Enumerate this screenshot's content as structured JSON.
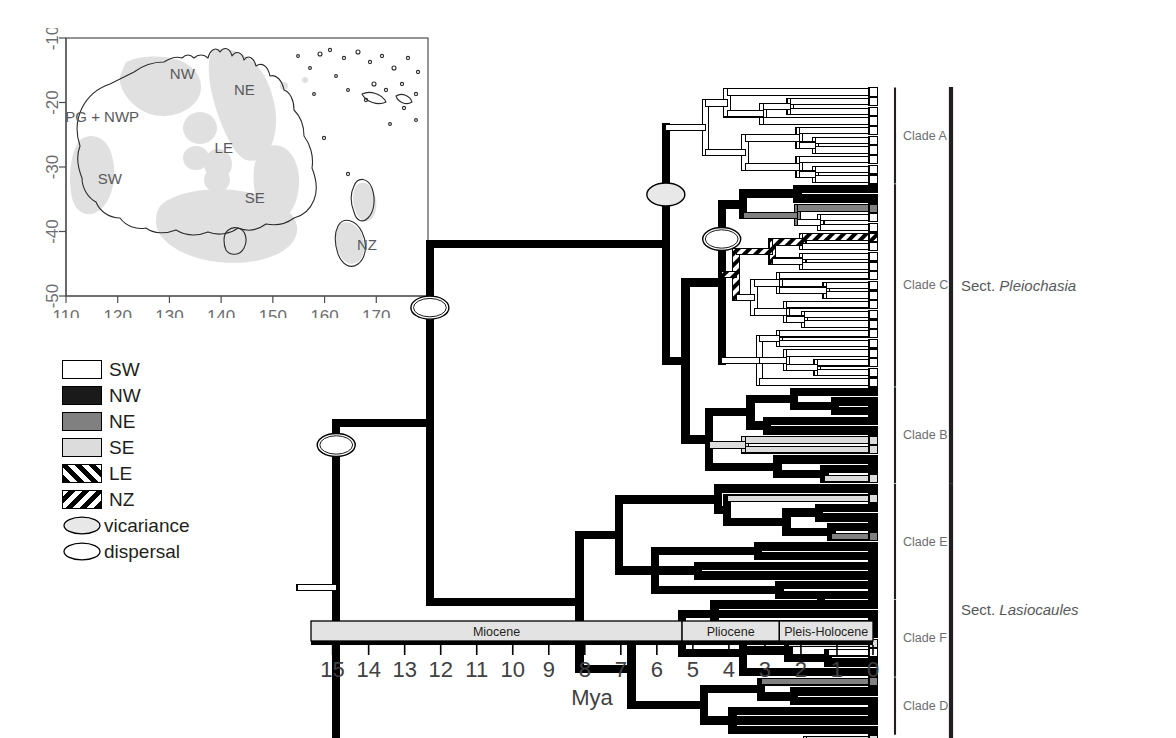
{
  "figure": {
    "type": "phylogenetic-chronogram-with-map-inset",
    "organism_group": "Utricularia (bladderworts)"
  },
  "map": {
    "title": "",
    "x_axis": {
      "ticks": [
        "110",
        "120",
        "130",
        "140",
        "150",
        "160",
        "170",
        "180"
      ],
      "min": 110,
      "max": 180
    },
    "y_axis": {
      "ticks": [
        "-10",
        "-20",
        "-30",
        "-40",
        "-50"
      ],
      "min": -50,
      "max": -10
    },
    "region_labels": [
      {
        "name": "NW",
        "text": "NW",
        "lon": 132.5,
        "lat": -15.5
      },
      {
        "name": "NE",
        "text": "NE",
        "lon": 144.5,
        "lat": -18.0
      },
      {
        "name": "PG + NWP",
        "text": "PG + NWP",
        "lon": 117.0,
        "lat": -22.2
      },
      {
        "name": "LE",
        "text": "LE",
        "lon": 140.5,
        "lat": -27.0
      },
      {
        "name": "SW",
        "text": "SW",
        "lon": 118.5,
        "lat": -31.8
      },
      {
        "name": "SE",
        "text": "SE",
        "lon": 146.5,
        "lat": -34.8
      },
      {
        "name": "NZ",
        "text": "NZ",
        "lon": 168.2,
        "lat": -42.0
      }
    ]
  },
  "legend": {
    "items": [
      {
        "label": "SW",
        "kind": "swatch",
        "fill": "#ffffff"
      },
      {
        "label": "NW",
        "kind": "swatch",
        "fill": "#1a1a1a"
      },
      {
        "label": "NE",
        "kind": "swatch",
        "fill": "#808080"
      },
      {
        "label": "SE",
        "kind": "swatch",
        "fill": "#dcdcdc"
      },
      {
        "label": "LE",
        "kind": "hatch",
        "fill": "#ffffff",
        "hatch": "forward"
      },
      {
        "label": "NZ",
        "kind": "hatch",
        "fill": "#ffffff",
        "hatch": "back"
      },
      {
        "label": "vicariance",
        "kind": "ellipse",
        "fill": "#e8e8e8"
      },
      {
        "label": "dispersal",
        "kind": "ellipse",
        "fill": "#ffffff"
      }
    ]
  },
  "axis": {
    "title": "Mya",
    "ticks": [
      "15",
      "14",
      "13",
      "12",
      "11",
      "10",
      "9",
      "8",
      "7",
      "6",
      "5",
      "4",
      "3",
      "2",
      "1",
      "0"
    ],
    "max_mya": 15.6,
    "min_mya": 0,
    "epochs": [
      {
        "name": "Miocene",
        "start": 15.6,
        "end": 5.3
      },
      {
        "name": "Pliocene",
        "start": 5.3,
        "end": 2.6
      },
      {
        "name": "Pleis-Holocene",
        "start": 2.6,
        "end": 0
      }
    ]
  },
  "clades": [
    {
      "id": "A",
      "label": "Clade A",
      "tip_start": 0,
      "tip_end": 9
    },
    {
      "id": "C",
      "label": "Clade C",
      "tip_start": 10,
      "tip_end": 30
    },
    {
      "id": "B",
      "label": "Clade B",
      "tip_start": 31,
      "tip_end": 40
    },
    {
      "id": "E",
      "label": "Clade E",
      "tip_start": 41,
      "tip_end": 52
    },
    {
      "id": "F",
      "label": "Clade F",
      "tip_start": 53,
      "tip_end": 60
    },
    {
      "id": "D",
      "label": "Clade D",
      "tip_start": 61,
      "tip_end": 66
    }
  ],
  "sections": [
    {
      "label_prefix": "Sect. ",
      "label_italic": "Pleiochasia",
      "tip_start": 0,
      "tip_end": 40
    },
    {
      "label_prefix": "Sect. ",
      "label_italic": "Lasiocaules",
      "tip_start": 41,
      "tip_end": 66
    },
    {
      "label_prefix": "Sect. ",
      "label_italic": "Polypompholyx/Tridentaria",
      "tip_start": 67,
      "tip_end": 69
    }
  ],
  "node_markers": [
    {
      "name": "root-dispersal",
      "type": "dispersal",
      "mya": 14.9,
      "tip_index": 36.5
    },
    {
      "name": "pleiochasia-dispersal",
      "type": "dispersal",
      "mya": 12.3,
      "tip_index": 22.3
    },
    {
      "name": "cladeAC-vicariance",
      "type": "vicariance",
      "mya": 5.75,
      "tip_index": 10.6
    },
    {
      "name": "cladeC-dispersal",
      "type": "dispersal",
      "mya": 4.2,
      "tip_index": 15.2
    }
  ],
  "tree": {
    "n_tips": 70,
    "tip_states": [
      "SW",
      "SW",
      "SW",
      "SW",
      "SW",
      "SW",
      "SW",
      "SW",
      "SW",
      "SW",
      "NW",
      "NW",
      "NE",
      "SW",
      "SW",
      "LE",
      "SW",
      "SW",
      "SW",
      "SW",
      "SW",
      "SW",
      "SW",
      "SW",
      "SW",
      "SW",
      "SW",
      "SW",
      "SW",
      "SW",
      "SW",
      "NW",
      "NW",
      "NW",
      "NW",
      "NW",
      "SE",
      "SE",
      "NW",
      "NW",
      "SE",
      "NW",
      "SE",
      "NW",
      "NW",
      "NW",
      "NE",
      "NW",
      "NW",
      "NW",
      "NW",
      "NW",
      "NW",
      "NW",
      "NW",
      "NW",
      "NW",
      "SE",
      "SW",
      "NW",
      "NW",
      "NE",
      "NW",
      "NW",
      "NW",
      "NW",
      "NW",
      "SE",
      "SW",
      "SW",
      "SW"
    ],
    "branches": [
      {
        "state": "SW",
        "mya0": 6.55,
        "mya1": 0.0,
        "tip": 0
      },
      {
        "state": "SW",
        "mya0": 4.05,
        "mya1": 0.0,
        "tip": 1
      },
      {
        "state": "SW",
        "mya0": 2.3,
        "mya1": 0.0,
        "tip": 2
      },
      {
        "state": "SW",
        "mya0": 2.3,
        "mya1": 0.0,
        "tip": 3
      },
      {
        "state": "SW",
        "mya0": 3.05,
        "mya1": 0.0,
        "tip": 4
      },
      {
        "state": "SW",
        "mya0": 1.6,
        "mya1": 0.0,
        "tip": 5
      },
      {
        "state": "SW",
        "mya0": 1.6,
        "mya1": 0.0,
        "tip": 6
      },
      {
        "state": "SW",
        "mya0": 3.55,
        "mya1": 0.0,
        "tip": 7
      },
      {
        "state": "SW",
        "mya0": 2.05,
        "mya1": 0.0,
        "tip": 8
      },
      {
        "state": "SW",
        "mya0": 2.05,
        "mya1": 0.0,
        "tip": 9
      },
      {
        "state": "NW",
        "mya0": 3.6,
        "mya1": 0.0,
        "tip": 10
      },
      {
        "state": "NW",
        "mya0": 2.1,
        "mya1": 0.0,
        "tip": 11
      },
      {
        "state": "NE",
        "mya0": 2.1,
        "mya1": 0.0,
        "tip": 12
      },
      {
        "state": "SW",
        "mya0": 2.8,
        "mya1": 0.0,
        "tip": 13
      },
      {
        "state": "SW",
        "mya0": 1.45,
        "mya1": 0.0,
        "tip": 14
      },
      {
        "state": "LE",
        "mya0": 1.45,
        "mya1": 0.0,
        "tip": 15
      },
      {
        "state": "SW",
        "mya0": 1.95,
        "mya1": 0.0,
        "tip": 16
      },
      {
        "state": "SW",
        "mya0": 1.95,
        "mya1": 0.0,
        "tip": 17
      },
      {
        "state": "SW",
        "mya0": 2.6,
        "mya1": 0.0,
        "tip": 18
      },
      {
        "state": "SW",
        "mya0": 1.3,
        "mya1": 0.0,
        "tip": 19
      },
      {
        "state": "SW",
        "mya0": 1.3,
        "mya1": 0.0,
        "tip": 20
      },
      {
        "state": "SW",
        "mya0": 3.3,
        "mya1": 0.0,
        "tip": 21
      },
      {
        "state": "SW",
        "mya0": 1.9,
        "mya1": 0.0,
        "tip": 22
      },
      {
        "state": "SW",
        "mya0": 1.9,
        "mya1": 0.0,
        "tip": 23
      },
      {
        "state": "SW",
        "mya0": 2.6,
        "mya1": 0.0,
        "tip": 24
      },
      {
        "state": "SW",
        "mya0": 2.6,
        "mya1": 0.0,
        "tip": 25
      },
      {
        "state": "SW",
        "mya0": 3.8,
        "mya1": 0.0,
        "tip": 26
      },
      {
        "state": "SW",
        "mya0": 2.4,
        "mya1": 0.0,
        "tip": 27
      },
      {
        "state": "SW",
        "mya0": 2.4,
        "mya1": 0.0,
        "tip": 28
      },
      {
        "state": "SW",
        "mya0": 3.15,
        "mya1": 0.0,
        "tip": 29
      },
      {
        "state": "SW",
        "mya0": 3.15,
        "mya1": 0.0,
        "tip": 30
      },
      {
        "state": "NW",
        "mya0": 2.2,
        "mya1": 0.0,
        "tip": 31
      },
      {
        "state": "NW",
        "mya0": 1.05,
        "mya1": 0.0,
        "tip": 32
      },
      {
        "state": "NW",
        "mya0": 1.05,
        "mya1": 0.0,
        "tip": 33
      },
      {
        "state": "NW",
        "mya0": 2.95,
        "mya1": 0.0,
        "tip": 34
      },
      {
        "state": "NW",
        "mya0": 2.95,
        "mya1": 0.0,
        "tip": 35
      },
      {
        "state": "SE",
        "mya0": 3.55,
        "mya1": 0.0,
        "tip": 36
      },
      {
        "state": "SE",
        "mya0": 3.55,
        "mya1": 0.0,
        "tip": 37
      },
      {
        "state": "NW",
        "mya0": 2.65,
        "mya1": 0.0,
        "tip": 38
      },
      {
        "state": "NW",
        "mya0": 1.35,
        "mya1": 0.0,
        "tip": 39
      },
      {
        "state": "SE",
        "mya0": 1.35,
        "mya1": 0.0,
        "tip": 40
      },
      {
        "state": "NW",
        "mya0": 4.3,
        "mya1": 0.0,
        "tip": 41
      },
      {
        "state": "SE",
        "mya0": 4.05,
        "mya1": 0.0,
        "tip": 42
      },
      {
        "state": "NW",
        "mya0": 2.4,
        "mya1": 0.0,
        "tip": 43
      },
      {
        "state": "NW",
        "mya0": 1.5,
        "mya1": 0.0,
        "tip": 44
      },
      {
        "state": "NW",
        "mya0": 1.5,
        "mya1": 0.0,
        "tip": 45
      },
      {
        "state": "NE",
        "mya0": 1.15,
        "mya1": 0.0,
        "tip": 46
      },
      {
        "state": "NW",
        "mya0": 1.15,
        "mya1": 0.0,
        "tip": 47
      },
      {
        "state": "NW",
        "mya0": 3.2,
        "mya1": 0.0,
        "tip": 48
      },
      {
        "state": "NW",
        "mya0": 3.2,
        "mya1": 0.0,
        "tip": 49
      },
      {
        "state": "NW",
        "mya0": 4.85,
        "mya1": 0.0,
        "tip": 50
      },
      {
        "state": "NW",
        "mya0": 4.85,
        "mya1": 0.0,
        "tip": 51
      },
      {
        "state": "NW",
        "mya0": 2.6,
        "mya1": 0.0,
        "tip": 52
      },
      {
        "state": "NW",
        "mya0": 1.45,
        "mya1": 0.0,
        "tip": 53
      },
      {
        "state": "NW",
        "mya0": 1.45,
        "mya1": 0.0,
        "tip": 54
      },
      {
        "state": "NW",
        "mya0": 4.4,
        "mya1": 0.0,
        "tip": 55
      },
      {
        "state": "SE",
        "mya0": 4.4,
        "mya1": 0.0,
        "tip": 56
      },
      {
        "state": "SW",
        "mya0": 4.4,
        "mya1": 0.0,
        "tip": 57
      },
      {
        "state": "NW",
        "mya0": 2.35,
        "mya1": 0.0,
        "tip": 58
      },
      {
        "state": "NW",
        "mya0": 1.25,
        "mya1": 0.0,
        "tip": 59
      },
      {
        "state": "NE",
        "mya0": 3.1,
        "mya1": 0.0,
        "tip": 60
      },
      {
        "state": "NW",
        "mya0": 3.1,
        "mya1": 0.0,
        "tip": 61
      },
      {
        "state": "NW",
        "mya0": 2.2,
        "mya1": 0.0,
        "tip": 62
      },
      {
        "state": "NW",
        "mya0": 2.2,
        "mya1": 0.0,
        "tip": 63
      },
      {
        "state": "NW",
        "mya0": 4.7,
        "mya1": 0.0,
        "tip": 64
      },
      {
        "state": "NW",
        "mya0": 4.7,
        "mya1": 0.0,
        "tip": 65
      },
      {
        "state": "SE",
        "mya0": 1.85,
        "mya1": 0.0,
        "tip": 66
      },
      {
        "state": "SW",
        "mya0": 1.85,
        "mya1": 0.0,
        "tip": 67
      },
      {
        "state": "SW",
        "mya0": 2.85,
        "mya1": 0.0,
        "tip": 68
      },
      {
        "state": "SW",
        "mya0": 4.55,
        "mya1": 0.0,
        "tip": 69
      }
    ],
    "internal": [
      {
        "name": "root",
        "state": "SW",
        "mya": 14.9,
        "left": "pleiochasia_lasio",
        "right": "outgroup",
        "stub": true
      },
      {
        "name": "pleiochasia_lasio",
        "state": "SW",
        "mya": 12.3,
        "left": "pleiochasia",
        "right": "lasiocaules"
      },
      {
        "name": "pleiochasia",
        "state": "SW",
        "mya": 5.75,
        "left": "cladeA",
        "right": "cladeCB"
      },
      {
        "name": "cladeCB",
        "state": "NW",
        "mya": 5.2,
        "left": "cladeC",
        "right": "cladeB"
      },
      {
        "name": "cladeC",
        "state": "SW",
        "mya": 4.2,
        "left": "cladeC_up",
        "right": "cladeC_dn"
      },
      {
        "name": "lasiocaules",
        "state": "NW",
        "mya": 8.15,
        "left": "cladeE",
        "right": "cladeFD"
      },
      {
        "name": "cladeFD",
        "state": "NW",
        "mya": 6.7,
        "left": "cladeF",
        "right": "cladeD"
      },
      {
        "name": "outgroup",
        "state": "SW",
        "mya": 2.85,
        "left": null,
        "right": null
      }
    ]
  },
  "colors": {
    "SW": "#ffffff",
    "NW": "#000000",
    "NE": "#808080",
    "SE": "#dcdcdc",
    "LE": "#ffffff",
    "NZ": "#ffffff",
    "outline": "#000000",
    "clade_bracket": "#231f20",
    "section_bracket": "#231f20",
    "epoch_band": "#e3e3e3",
    "map_land": "#ffffff",
    "map_range": "#e0e0e0",
    "map_outline": "#4d4d4d"
  }
}
